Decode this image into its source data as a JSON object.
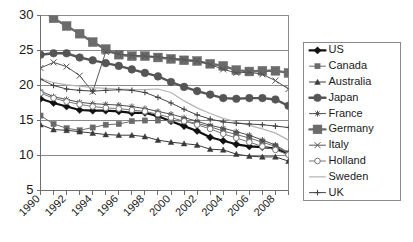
{
  "chart_data": {
    "type": "line",
    "title": "",
    "xlabel": "",
    "ylabel": "",
    "xlim": [
      1990,
      2009
    ],
    "ylim": [
      5,
      30
    ],
    "yticks": [
      5,
      10,
      15,
      20,
      25,
      30
    ],
    "ytick_labels": [
      "5",
      "10",
      "15",
      "20",
      "25",
      "30"
    ],
    "gridlines_y": [
      10,
      15,
      20,
      25
    ],
    "grid": true,
    "legend_position": "right",
    "x": [
      1990,
      1991,
      1992,
      1993,
      1994,
      1995,
      1996,
      1997,
      1998,
      1999,
      2000,
      2001,
      2002,
      2003,
      2004,
      2005,
      2006,
      2007,
      2008,
      2009
    ],
    "xtick_labels": [
      "1990",
      "",
      "1992",
      "",
      "1994",
      "",
      "1996",
      "",
      "1998",
      "",
      "2000",
      "",
      "2002",
      "",
      "2004",
      "",
      "2006",
      "",
      "2008",
      ""
    ],
    "series": [
      {
        "name": "US",
        "marker": "diamond",
        "color": "#111111",
        "line_width": 2.2,
        "marker_size": 3.6,
        "values": [
          18.1,
          17.5,
          17.0,
          16.5,
          16.4,
          16.4,
          16.3,
          16.1,
          16.1,
          15.6,
          14.9,
          14.2,
          13.5,
          12.6,
          12.1,
          11.6,
          11.3,
          11.2,
          11.0,
          10.2
        ]
      },
      {
        "name": "Canada",
        "marker": "square",
        "color": "#6a6a6a",
        "line_width": 1.0,
        "marker_size": 2.6,
        "values": [
          15.7,
          14.5,
          13.9,
          13.6,
          14.0,
          14.4,
          14.5,
          14.9,
          15.0,
          15.0,
          15.0,
          14.9,
          14.6,
          14.1,
          13.5,
          13.0,
          12.5,
          11.9,
          11.3,
          10.3
        ]
      },
      {
        "name": "Australia",
        "marker": "triangle",
        "color": "#3a3a3a",
        "line_width": 1.0,
        "marker_size": 2.8,
        "values": [
          14.4,
          13.7,
          13.6,
          13.4,
          13.2,
          13.0,
          12.9,
          12.9,
          12.7,
          12.2,
          11.9,
          11.7,
          11.5,
          10.9,
          10.8,
          10.2,
          9.9,
          9.8,
          9.8,
          9.2
        ]
      },
      {
        "name": "Japan",
        "marker": "circle",
        "color": "#555555",
        "line_width": 2.4,
        "marker_size": 3.8,
        "values": [
          24.4,
          24.6,
          24.6,
          24.0,
          23.6,
          23.2,
          22.8,
          22.3,
          21.8,
          21.3,
          20.5,
          19.8,
          19.2,
          18.7,
          18.2,
          18.1,
          18.2,
          18.2,
          18.0,
          17.1
        ]
      },
      {
        "name": "France",
        "marker": "star",
        "color": "#4f4f4f",
        "line_width": 1.0,
        "marker_size": 3.0,
        "values": [
          19.2,
          18.4,
          18.0,
          17.6,
          17.4,
          17.3,
          17.2,
          17.0,
          16.7,
          16.3,
          15.9,
          15.4,
          14.9,
          14.3,
          13.9,
          13.4,
          12.9,
          12.2,
          11.5,
          10.4
        ]
      },
      {
        "name": "Germany",
        "marker": "square",
        "color": "#6b6b6b",
        "line_width": 2.4,
        "marker_size": 4.4,
        "values": [
          31.0,
          29.6,
          28.5,
          27.4,
          26.2,
          25.2,
          24.4,
          24.2,
          24.2,
          24.0,
          23.8,
          23.6,
          23.5,
          23.1,
          22.8,
          22.2,
          22.0,
          22.1,
          22.1,
          21.8
        ]
      },
      {
        "name": "Italy",
        "marker": "cross",
        "color": "#555555",
        "line_width": 1.0,
        "marker_size": 3.0,
        "values": [
          22.5,
          23.3,
          22.7,
          21.4,
          19.1,
          24.8,
          24.5,
          24.3,
          24.2,
          24.1,
          23.9,
          23.7,
          23.5,
          23.0,
          22.3,
          21.8,
          21.9,
          21.6,
          20.7,
          19.5
        ]
      },
      {
        "name": "Holland",
        "marker": "opencircle",
        "color": "#777777",
        "line_width": 1.0,
        "marker_size": 2.8,
        "values": [
          18.9,
          18.2,
          17.7,
          17.3,
          17.0,
          16.8,
          16.7,
          16.5,
          16.3,
          15.9,
          15.4,
          14.9,
          14.4,
          13.8,
          13.1,
          12.5,
          11.9,
          11.3,
          10.8,
          10.1
        ]
      },
      {
        "name": "Sweden",
        "marker": "none",
        "color": "#b5b5b5",
        "line_width": 1.2,
        "marker_size": 0,
        "values": [
          21.0,
          20.4,
          20.1,
          19.9,
          19.7,
          19.6,
          19.5,
          19.4,
          19.4,
          19.5,
          19.0,
          17.8,
          16.8,
          16.0,
          15.3,
          14.8,
          14.3,
          13.8,
          13.2,
          12.2
        ]
      },
      {
        "name": "UK",
        "marker": "plus",
        "color": "#444444",
        "line_width": 1.0,
        "marker_size": 2.8,
        "values": [
          20.9,
          20.0,
          19.5,
          19.3,
          19.2,
          19.3,
          19.4,
          19.3,
          19.0,
          18.3,
          17.5,
          16.6,
          15.8,
          15.2,
          14.8,
          14.6,
          14.5,
          14.4,
          14.2,
          14.0
        ]
      }
    ]
  },
  "legend": {
    "items": [
      {
        "label": "US"
      },
      {
        "label": "Canada"
      },
      {
        "label": "Australia"
      },
      {
        "label": "Japan"
      },
      {
        "label": "France"
      },
      {
        "label": "Germany"
      },
      {
        "label": "Italy"
      },
      {
        "label": "Holland"
      },
      {
        "label": "Sweden"
      },
      {
        "label": "UK"
      }
    ]
  },
  "colors": {
    "background": "#ffffff",
    "axis": "#6e6e6e",
    "grid": "#8a8a8a",
    "text": "#1a1a1a"
  }
}
